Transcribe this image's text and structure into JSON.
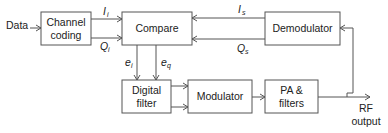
{
  "diagram": {
    "type": "block-diagram",
    "inputs": {
      "data_label": "Data"
    },
    "blocks": {
      "channel_coding": {
        "line1": "Channel",
        "line2": "coding"
      },
      "compare": {
        "label": "Compare"
      },
      "demodulator": {
        "label": "Demodulator"
      },
      "digital_filter": {
        "line1": "Digital",
        "line2": "filter"
      },
      "modulator": {
        "label": "Modulator"
      },
      "pa_filters": {
        "line1": "PA &",
        "line2": "filters"
      }
    },
    "signals": {
      "Ii": {
        "main": "I",
        "sub": "i"
      },
      "Qi": {
        "main": "Q",
        "sub": "i"
      },
      "Is": {
        "main": "I",
        "sub": "s"
      },
      "Qs": {
        "main": "Q",
        "sub": "s"
      },
      "ei": {
        "main": "e",
        "sub": "i"
      },
      "eq": {
        "main": "e",
        "sub": "q"
      }
    },
    "output": {
      "line1": "RF",
      "line2": "output"
    },
    "colors": {
      "stroke": "#555555",
      "text": "#222222",
      "background": "#ffffff"
    }
  }
}
